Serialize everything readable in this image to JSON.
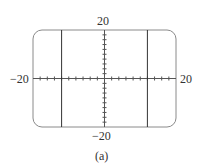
{
  "chart_data": {
    "type": "line",
    "title": "",
    "caption": "(a)",
    "xlabel": "",
    "ylabel": "",
    "xlim": [
      -20,
      20
    ],
    "ylim": [
      -20,
      20
    ],
    "tick_labels": {
      "x_min": "−20",
      "x_max": "20",
      "y_min": "−20",
      "y_max": "20"
    },
    "tick_step": 2,
    "grid": false,
    "frame": "rounded-rectangle",
    "series": [
      {
        "name": "vertical line left",
        "type": "vline",
        "x": -12
      },
      {
        "name": "vertical line right",
        "type": "vline",
        "x": 12
      }
    ],
    "colors": {
      "axis": "#555555",
      "frame": "#888888",
      "curve": "#333333"
    }
  }
}
